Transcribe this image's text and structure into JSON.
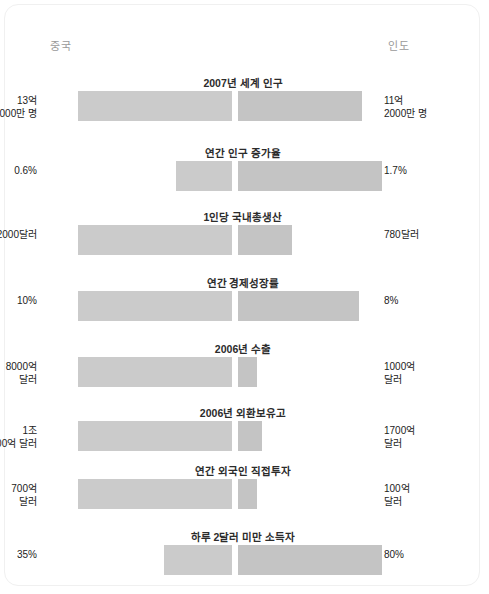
{
  "header": {
    "left_label": "중국",
    "right_label": "인도"
  },
  "style": {
    "bar_left_color": "#cbcbcb",
    "bar_right_color": "#c4c4c4",
    "background": "#ffffff",
    "title_color": "#2b2b2b",
    "header_color": "#9a9a9a"
  },
  "chart_data": {
    "type": "bar",
    "xlabel": "",
    "ylabel": "",
    "orientation": "horizontal-diverging",
    "categories": [
      "2007년 세계 인구",
      "연간 인구 증가율",
      "1인당 국내총생산",
      "연간 경제성장률",
      "2006년 수출",
      "2006년 외환보유고",
      "연간 외국인 직접투자",
      "하루 2달러 미만 소득자"
    ],
    "series": [
      {
        "name": "중국",
        "labels": [
          "13억\n1000만 명",
          "0.6%",
          "2000달러",
          "10%",
          "8000억\n달러",
          "1조\n500억 달러",
          "700억\n달러",
          "35%"
        ],
        "values": [
          1310000000,
          0.6,
          2000,
          10,
          800,
          1050,
          700,
          35
        ]
      },
      {
        "name": "인도",
        "labels": [
          "11억\n2000만 명",
          "1.7%",
          "780달러",
          "8%",
          "1000억\n달러",
          "1700억\n달러",
          "100억\n달러",
          "80%"
        ],
        "values": [
          1120000000,
          1.7,
          780,
          8,
          100,
          170,
          10,
          80
        ]
      }
    ]
  },
  "rows": [
    {
      "title": "2007년 세계 인구",
      "left_value": "13억\n1000만 명",
      "right_value": "11억\n2000만 명",
      "left_px": 154,
      "right_px": 124,
      "top": 70
    },
    {
      "title": "연간 인구 증가율",
      "left_value": "0.6%",
      "right_value": "1.7%",
      "left_px": 56,
      "right_px": 144,
      "top": 140
    },
    {
      "title": "1인당 국내총생산",
      "left_value": "2000달러",
      "right_value": "780달러",
      "left_px": 154,
      "right_px": 54,
      "top": 204
    },
    {
      "title": "연간 경제성장률",
      "left_value": "10%",
      "right_value": "8%",
      "left_px": 154,
      "right_px": 121,
      "top": 270
    },
    {
      "title": "2006년 수출",
      "left_value": "8000억\n달러",
      "right_value": "1000억\n달러",
      "left_px": 154,
      "right_px": 19,
      "top": 336
    },
    {
      "title": "2006년 외환보유고",
      "left_value": "1조\n500억 달러",
      "right_value": "1700억\n달러",
      "left_px": 154,
      "right_px": 24,
      "top": 400
    },
    {
      "title": "연간 외국인 직접투자",
      "left_value": "700억\n달러",
      "right_value": "100억\n달러",
      "left_px": 154,
      "right_px": 19,
      "top": 458
    },
    {
      "title": "하루 2달러 미만 소득자",
      "left_value": "35%",
      "right_value": "80%",
      "left_px": 68,
      "right_px": 144,
      "top": 524
    }
  ]
}
